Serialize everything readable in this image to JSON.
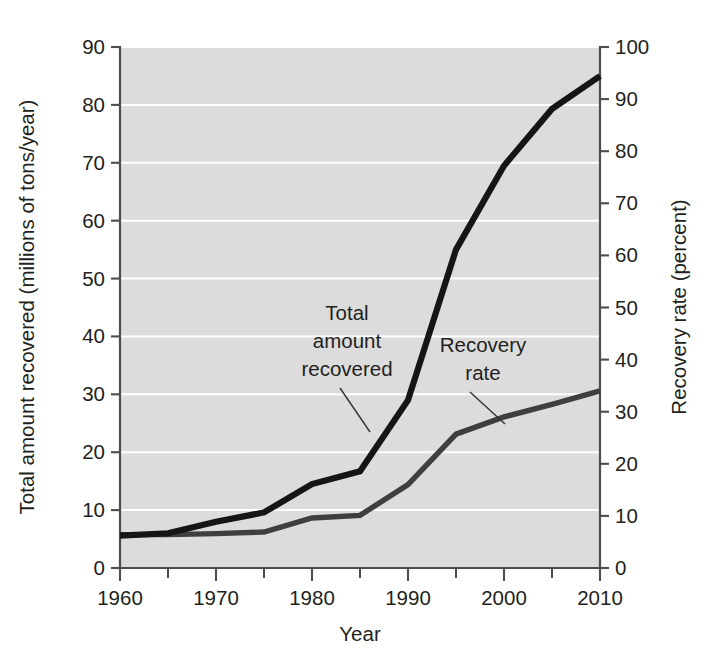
{
  "chart_data": {
    "type": "line",
    "title": "",
    "xlabel": "Year",
    "ylabel": "Total amount recovered (millions of tons/year)",
    "y2label": "Recovery rate (percent)",
    "xlim": [
      1960,
      2010
    ],
    "ylim": [
      0,
      90
    ],
    "y2lim": [
      0,
      100
    ],
    "grid": true,
    "legend_position": "inline-annotations",
    "x_ticks_major": [
      1960,
      1970,
      1980,
      1990,
      2000,
      2010
    ],
    "x_ticks_minor": [
      1965,
      1975,
      1985,
      1995,
      2005
    ],
    "x_tick_labels": [
      "1960",
      "1970",
      "1980",
      "1990",
      "2000",
      "2010"
    ],
    "y_ticks": [
      0,
      10,
      20,
      30,
      40,
      50,
      60,
      70,
      80,
      90
    ],
    "y_tick_labels": [
      "0",
      "10",
      "20",
      "30",
      "40",
      "50",
      "60",
      "70",
      "80",
      "90"
    ],
    "y2_ticks": [
      0,
      10,
      20,
      30,
      40,
      50,
      60,
      70,
      80,
      90,
      100
    ],
    "y2_tick_labels": [
      "0",
      "10",
      "20",
      "30",
      "40",
      "50",
      "60",
      "70",
      "80",
      "90",
      "100"
    ],
    "series": [
      {
        "name": "Total amount recovered",
        "axis": "left",
        "units": "millions of tons/year",
        "color": "#151515",
        "x": [
          1960,
          1965,
          1970,
          1975,
          1980,
          1985,
          1990,
          1995,
          2000,
          2005,
          2010
        ],
        "values": [
          5.6,
          6.0,
          8.0,
          9.6,
          14.5,
          16.7,
          29.0,
          55.0,
          69.5,
          79.3,
          85.0
        ]
      },
      {
        "name": "Recovery rate",
        "axis": "right",
        "units": "percent",
        "color": "#3f3f3f",
        "x": [
          1960,
          1965,
          1970,
          1975,
          1980,
          1985,
          1990,
          1995,
          2000,
          2005,
          2010
        ],
        "values": [
          6.4,
          6.4,
          6.6,
          6.9,
          9.6,
          10.1,
          16.0,
          25.7,
          29.0,
          31.4,
          34.0
        ]
      }
    ],
    "annotations": [
      {
        "id": "total-amount-recovered",
        "lines": [
          "Total",
          "amount",
          "recovered"
        ],
        "text": "Total amount recovered",
        "target_x": 1985,
        "target_series": "Total amount recovered"
      },
      {
        "id": "recovery-rate",
        "lines": [
          "Recovery",
          "rate"
        ],
        "text": "Recovery rate",
        "target_x": 2000,
        "target_series": "Recovery rate"
      }
    ],
    "colors": {
      "plot_background": "#dcdcdc",
      "gridline": "#ffffff",
      "axis": "#4d4d4d",
      "text": "#231f20",
      "page_background": "#ffffff"
    }
  }
}
